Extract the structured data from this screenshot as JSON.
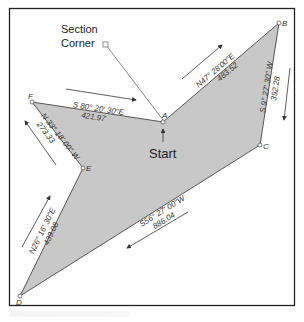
{
  "diagram": {
    "type": "traverse-plat",
    "colors": {
      "fill": "#c8c8c8",
      "line": "#555555",
      "frame": "#222222",
      "text": "#333333"
    },
    "labels": {
      "section_corner_line1": "Section",
      "section_corner_line2": "Corner",
      "start": "Start"
    },
    "stations": [
      {
        "id": "A",
        "label": "A"
      },
      {
        "id": "B",
        "label": "B"
      },
      {
        "id": "C",
        "label": "C"
      },
      {
        "id": "D",
        "label": "D"
      },
      {
        "id": "E",
        "label": "E"
      },
      {
        "id": "F",
        "label": "F"
      }
    ],
    "courses": [
      {
        "from": "A",
        "to": "B",
        "bearing": "N47° 28'00\"E",
        "distance": "483.52"
      },
      {
        "from": "B",
        "to": "C",
        "bearing": "S 9° 27' 30\" W",
        "distance": "392.28"
      },
      {
        "from": "C",
        "to": "D",
        "bearing": "S56° 27' 00\"W",
        "distance": "886.04"
      },
      {
        "from": "D",
        "to": "E",
        "bearing": "N26° 16' 30\"E",
        "distance": "439.08"
      },
      {
        "from": "E",
        "to": "F",
        "bearing": "N 33° 18' 00\" W",
        "distance": "273.33"
      },
      {
        "from": "F",
        "to": "A",
        "bearing": "S 80° 20' 30\"E",
        "distance": "421.97"
      }
    ]
  }
}
